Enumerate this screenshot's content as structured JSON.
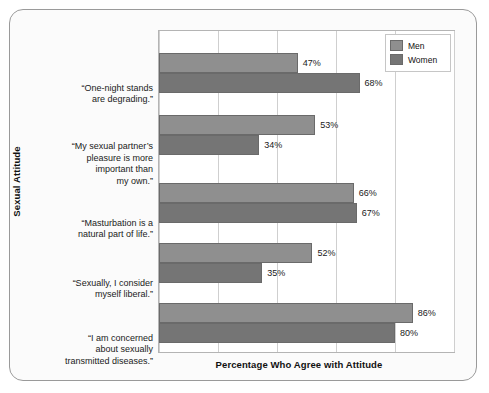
{
  "chart_data": {
    "type": "bar",
    "orientation": "horizontal",
    "title": "",
    "xlabel": "Percentage Who Agree with Attitude",
    "ylabel": "Sexual Attitude",
    "xlim": [
      0,
      100
    ],
    "grid": true,
    "gridline_values": [
      0,
      20,
      40,
      60,
      80,
      100
    ],
    "tick_labels_visible": false,
    "legend_position": "top-right",
    "categories": [
      "“One-night stands are degrading.”",
      "“My sexual partner’s pleasure is more important than my own.”",
      "“Masturbation is a natural part of life.”",
      "“Sexually, I consider myself liberal.”",
      "“I am concerned about sexually transmitted diseases.”"
    ],
    "category_lines": [
      [
        "“One-night stands",
        "are degrading.”"
      ],
      [
        "“My sexual partner’s",
        "pleasure is more",
        "important than",
        "my own.”"
      ],
      [
        "“Masturbation is a",
        "natural part of life.”"
      ],
      [
        "“Sexually, I consider",
        "myself liberal.”"
      ],
      [
        "“I am concerned",
        "about sexually",
        "transmitted diseases.”"
      ]
    ],
    "series": [
      {
        "name": "Men",
        "color": "#8f8f8f",
        "values": [
          47,
          53,
          66,
          52,
          86
        ],
        "value_labels": [
          "47%",
          "53%",
          "66%",
          "52%",
          "86%"
        ]
      },
      {
        "name": "Women",
        "color": "#757575",
        "values": [
          68,
          34,
          67,
          35,
          80
        ],
        "value_labels": [
          "68%",
          "34%",
          "67%",
          "35%",
          "80%"
        ]
      }
    ]
  },
  "legend": {
    "items": [
      {
        "label": "Men",
        "color": "#8f8f8f"
      },
      {
        "label": "Women",
        "color": "#757575"
      }
    ]
  },
  "axes": {
    "x_title": "Percentage Who Agree with Attitude",
    "y_title": "Sexual Attitude"
  },
  "colors": {
    "men_bar": "#8f8f8f",
    "women_bar": "#757575",
    "bar_border": "#6a6a6a",
    "plot_background": "#ffffff",
    "figure_background": "#fbfbfb",
    "frame_border": "#9a9a9a",
    "gridline": "#cfcfcf",
    "text": "#1a1a1a"
  }
}
